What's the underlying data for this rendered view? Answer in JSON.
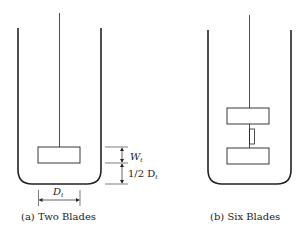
{
  "figure": {
    "panels": [
      {
        "id": "a",
        "caption": "(a)  Two Blades",
        "impeller": "two blades",
        "dimensions": {
          "blade_width_label": "W",
          "blade_width_sub": "t",
          "clearance_label": "1/2 D",
          "clearance_sub": "t",
          "diameter_label": "D",
          "diameter_sub": "t"
        }
      },
      {
        "id": "b",
        "caption": "(b)  Six Blades",
        "impeller": "six blades"
      }
    ],
    "colors": {
      "stroke": "#222222",
      "background": "#ffffff"
    }
  }
}
